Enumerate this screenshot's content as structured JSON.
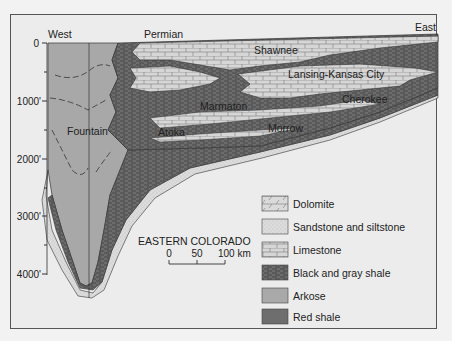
{
  "diagram": {
    "directions": {
      "west": "West",
      "east": "East"
    },
    "depth_axis": {
      "ticks": [
        "0",
        "1000'",
        "2000'",
        "3000'",
        "4000'"
      ]
    },
    "unit_labels": {
      "permian": "Permian",
      "shawnee": "Shawnee",
      "lansing_kansas_city": "Lansing-Kansas City",
      "cherokee": "Cherokee",
      "marmaton": "Marmaton",
      "atoka": "Atoka",
      "morrow": "Morrow",
      "fountain": "Fountain"
    },
    "scale_bar": {
      "region": "EASTERN COLORADO",
      "ticks": [
        "0",
        "50",
        "100 km"
      ]
    },
    "legend": {
      "items": [
        {
          "label": "Dolomite",
          "pattern": "dolomite"
        },
        {
          "label": "Sandstone and siltstone",
          "pattern": "sandstone"
        },
        {
          "label": "Limestone",
          "pattern": "limestone"
        },
        {
          "label": "Black and gray shale",
          "pattern": "black-gray-shale"
        },
        {
          "label": "Arkose",
          "pattern": "arkose"
        },
        {
          "label": "Red shale",
          "pattern": "red-shale"
        }
      ]
    },
    "colors": {
      "background": "#ececec",
      "arkose": "#a9a9a9",
      "limestone": "#d4d4d4",
      "shale": "#6a6a6a",
      "sandstone": "#d8d8d8"
    }
  }
}
